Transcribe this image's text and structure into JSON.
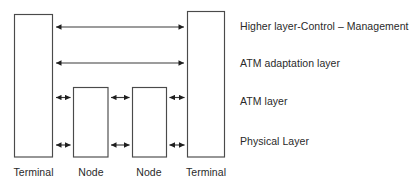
{
  "diagram": {
    "colors": {
      "background": "#ffffff",
      "box_stroke": "#4a4a4a",
      "line_stroke": "#3a3a3a",
      "text": "#2a2a2a"
    },
    "layer_labels": [
      {
        "id": "higher-layer",
        "text": "Higher layer-Control – Management"
      },
      {
        "id": "aal",
        "text": "ATM adaptation layer"
      },
      {
        "id": "atm",
        "text": "ATM layer"
      },
      {
        "id": "physical",
        "text": "Physical Layer"
      }
    ],
    "nodes": [
      {
        "id": "terminal-left",
        "label": "Terminal"
      },
      {
        "id": "node-1",
        "label": "Node"
      },
      {
        "id": "node-2",
        "label": "Node"
      },
      {
        "id": "terminal-right",
        "label": "Terminal"
      }
    ]
  }
}
